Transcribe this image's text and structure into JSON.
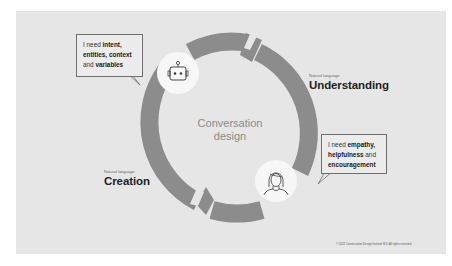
{
  "diagram": {
    "center_label_line1": "Conversation",
    "center_label_line2": "design",
    "stages": [
      {
        "sub": "Natural language",
        "title": "Understanding"
      },
      {
        "sub": "Natural language",
        "title": "Creation"
      }
    ],
    "bubbles": {
      "bot": {
        "prefix": "I need ",
        "b1": "intent,",
        "b2": "entities, context",
        "mid": "and ",
        "b3": "variables"
      },
      "user": {
        "prefix": "I need ",
        "b1": "empathy,",
        "b2": "helpfulness",
        "mid": " and",
        "b3": "encouragement"
      }
    },
    "icons": [
      "robot-icon",
      "person-icon"
    ],
    "copyright": "© 2022 Conversation Design Institute B.V. All rights reserved",
    "colors": {
      "background": "#e6e6e6",
      "ring": "#8c8c8c",
      "icon_circle": "#f7f7f7",
      "text_dark": "#1f1f1f",
      "center_text": "#8a8a8a"
    }
  }
}
